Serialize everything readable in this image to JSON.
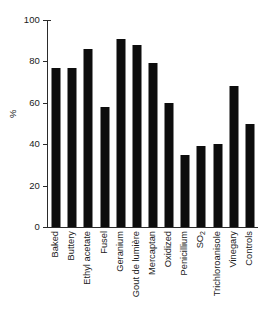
{
  "chart_data": {
    "type": "bar",
    "title": "",
    "subtitle": "",
    "xlabel": "",
    "ylabel": "%",
    "ylim": [
      0,
      100
    ],
    "yticks": [
      0,
      20,
      40,
      60,
      80,
      100
    ],
    "ytick_labels": [
      "0",
      "20",
      "40",
      "60",
      "80",
      "100"
    ],
    "grid": false,
    "legend": false,
    "bar_color": "#0d0d0d",
    "axis_color": "#2b2b2b",
    "categories": [
      "Baked",
      "Buttery",
      "Ethyl acetate",
      "Fusel",
      "Geranium",
      "Gout de lumière",
      "Mercaptan",
      "Oxidized",
      "Penicillium",
      "SO2",
      "Trichloroanisole",
      "Vinegary",
      "Controls"
    ],
    "category_labels_html": [
      "Baked",
      "Buttery",
      "Ethyl acetate",
      "Fusel",
      "Geranium",
      "Gout de lumière",
      "Mercaptan",
      "Oxidized",
      "Penicillium",
      "SO<sub>2</sub>",
      "Trichloroanisole",
      "Vinegary",
      "Controls"
    ],
    "values": [
      77,
      77,
      86,
      58,
      91,
      88,
      79,
      60,
      35,
      39,
      40,
      68,
      50
    ]
  }
}
